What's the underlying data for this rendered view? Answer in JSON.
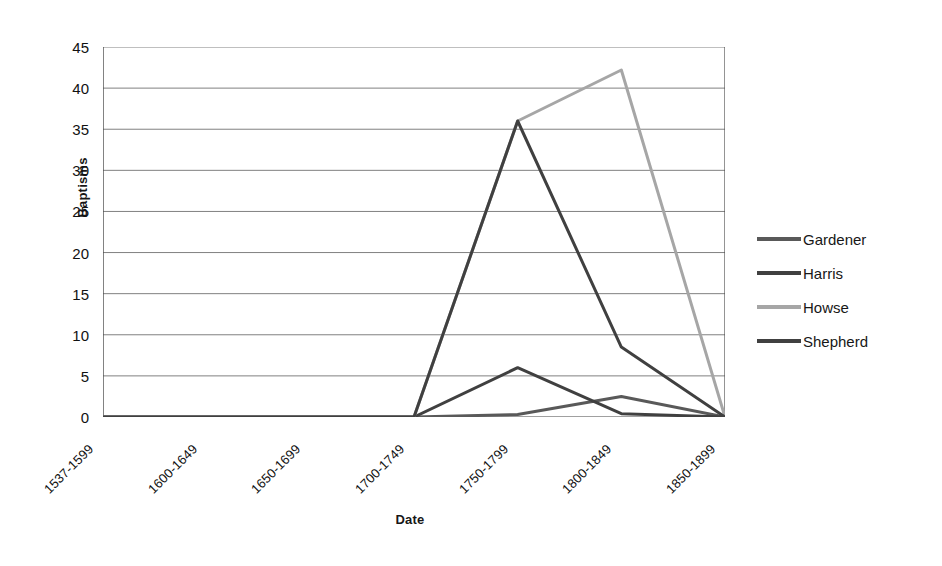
{
  "chart_data": {
    "type": "line",
    "title": "",
    "xlabel": "Date",
    "ylabel": "Baptisms",
    "categories": [
      "1537-1599",
      "1600-1649",
      "1650-1699",
      "1700-1749",
      "1750-1799",
      "1800-1849",
      "1850-1899"
    ],
    "ylim": [
      0,
      45
    ],
    "ytick_step": 5,
    "ytick_labels": [
      "45",
      "40",
      "35",
      "30",
      "25",
      "20",
      "15",
      "10",
      "5",
      "0"
    ],
    "grid": "horizontal",
    "legend_position": "right",
    "series": [
      {
        "name": "Gardener",
        "color": "#595959",
        "values": [
          0,
          0,
          0,
          0,
          0.3,
          2.5,
          0
        ]
      },
      {
        "name": "Harris",
        "color": "#404040",
        "values": [
          0,
          0,
          0,
          0,
          6,
          0.4,
          0
        ]
      },
      {
        "name": "Howse",
        "color": "#a6a6a6",
        "values": [
          0,
          0,
          0,
          0,
          36,
          42.2,
          0
        ]
      },
      {
        "name": "Shepherd",
        "color": "#404040",
        "values": [
          0,
          0,
          0,
          0,
          36,
          8.5,
          0
        ]
      }
    ]
  },
  "legend": {
    "items": [
      {
        "label": "Gardener"
      },
      {
        "label": "Harris"
      },
      {
        "label": "Howse"
      },
      {
        "label": "Shepherd"
      }
    ]
  },
  "colors": {
    "grid": "#808080",
    "axis": "#4d4d4d",
    "dark_series": "#404040",
    "mid_series": "#595959",
    "light_series": "#a6a6a6"
  }
}
